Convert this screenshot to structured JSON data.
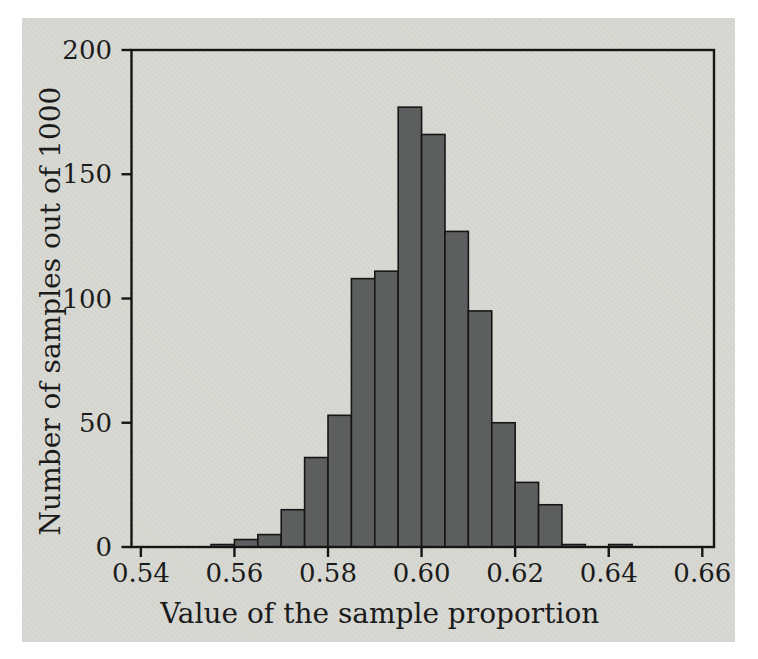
{
  "figure": {
    "page_background": "#ffffff",
    "panel_color": "#d8d8d3",
    "frame_color": "#151515",
    "tick_color": "#151515",
    "text_color": "#1b1b1b"
  },
  "chart_data": {
    "type": "bar",
    "subtype": "histogram",
    "title": "",
    "xlabel": "Value of the sample proportion",
    "ylabel": "Number of samples out of 1000",
    "xlim": [
      0.538,
      0.6625
    ],
    "ylim": [
      0,
      200
    ],
    "grid": "off",
    "legend": "none",
    "bin_width": 0.005,
    "bins": [
      {
        "from": 0.555,
        "to": 0.56,
        "count": 1
      },
      {
        "from": 0.56,
        "to": 0.565,
        "count": 3
      },
      {
        "from": 0.565,
        "to": 0.57,
        "count": 5
      },
      {
        "from": 0.57,
        "to": 0.575,
        "count": 15
      },
      {
        "from": 0.575,
        "to": 0.58,
        "count": 36
      },
      {
        "from": 0.58,
        "to": 0.585,
        "count": 53
      },
      {
        "from": 0.585,
        "to": 0.59,
        "count": 108
      },
      {
        "from": 0.59,
        "to": 0.595,
        "count": 111
      },
      {
        "from": 0.595,
        "to": 0.6,
        "count": 177
      },
      {
        "from": 0.6,
        "to": 0.605,
        "count": 166
      },
      {
        "from": 0.605,
        "to": 0.61,
        "count": 127
      },
      {
        "from": 0.61,
        "to": 0.615,
        "count": 95
      },
      {
        "from": 0.615,
        "to": 0.62,
        "count": 50
      },
      {
        "from": 0.62,
        "to": 0.625,
        "count": 26
      },
      {
        "from": 0.625,
        "to": 0.63,
        "count": 17
      },
      {
        "from": 0.63,
        "to": 0.635,
        "count": 1
      },
      {
        "from": 0.635,
        "to": 0.64,
        "count": 0
      },
      {
        "from": 0.64,
        "to": 0.645,
        "count": 1
      }
    ],
    "x_ticks": [
      0.54,
      0.56,
      0.58,
      0.6,
      0.62,
      0.64,
      0.66
    ],
    "x_tick_labels": [
      "0.54",
      "0.56",
      "0.58",
      "0.60",
      "0.62",
      "0.64",
      "0.66"
    ],
    "y_ticks": [
      0,
      50,
      100,
      150,
      200
    ],
    "y_tick_labels": [
      "0",
      "50",
      "100",
      "150",
      "200"
    ],
    "bar_fill": "#5d5e5e",
    "bar_stroke": "#161616"
  }
}
